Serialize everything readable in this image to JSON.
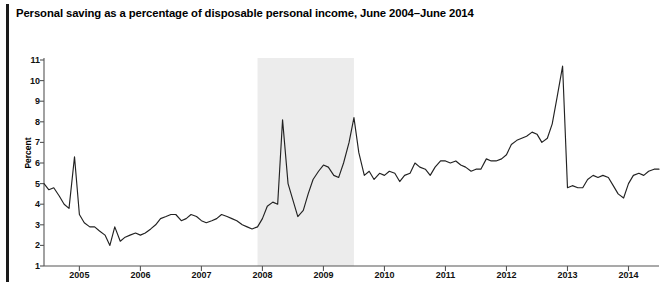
{
  "figure": {
    "title": "Personal saving as a percentage of disposable personal income, June 2004–June 2014",
    "ylabel": "Percent"
  },
  "chart_data": {
    "type": "line",
    "title": "Personal saving as a percentage of disposable personal income, June 2004–June 2014",
    "xlabel": "",
    "ylabel": "Percent",
    "xlim": [
      2004.42,
      2014.5
    ],
    "ylim": [
      1,
      11
    ],
    "ytick_labels": [
      "1",
      "2",
      "3",
      "4",
      "5",
      "6",
      "7",
      "8",
      "9",
      "10",
      "11"
    ],
    "yticks": [
      1,
      2,
      3,
      4,
      5,
      6,
      7,
      8,
      9,
      10,
      11
    ],
    "xtick_labels": [
      "2005",
      "2006",
      "2007",
      "2008",
      "2009",
      "2010",
      "2011",
      "2012",
      "2013",
      "2014"
    ],
    "xticks": [
      2005,
      2006,
      2007,
      2008,
      2009,
      2010,
      2011,
      2012,
      2013,
      2014
    ],
    "grid": false,
    "legend": null,
    "line_color": "#222222",
    "shaded_regions": [
      {
        "name": "recession-band",
        "x_start": 2007.92,
        "x_end": 2009.5,
        "color": "#ececec"
      }
    ],
    "series": [
      {
        "name": "Personal saving rate",
        "x": [
          2004.42,
          2004.5,
          2004.58,
          2004.67,
          2004.75,
          2004.83,
          2004.92,
          2005.0,
          2005.08,
          2005.17,
          2005.25,
          2005.33,
          2005.42,
          2005.5,
          2005.58,
          2005.67,
          2005.75,
          2005.83,
          2005.92,
          2006.0,
          2006.08,
          2006.17,
          2006.25,
          2006.33,
          2006.42,
          2006.5,
          2006.58,
          2006.67,
          2006.75,
          2006.83,
          2006.92,
          2007.0,
          2007.08,
          2007.17,
          2007.25,
          2007.33,
          2007.42,
          2007.5,
          2007.58,
          2007.67,
          2007.75,
          2007.83,
          2007.92,
          2008.0,
          2008.08,
          2008.17,
          2008.25,
          2008.33,
          2008.42,
          2008.5,
          2008.58,
          2008.67,
          2008.75,
          2008.83,
          2008.92,
          2009.0,
          2009.08,
          2009.17,
          2009.25,
          2009.33,
          2009.42,
          2009.5,
          2009.58,
          2009.67,
          2009.75,
          2009.83,
          2009.92,
          2010.0,
          2010.08,
          2010.17,
          2010.25,
          2010.33,
          2010.42,
          2010.5,
          2010.58,
          2010.67,
          2010.75,
          2010.83,
          2010.92,
          2011.0,
          2011.08,
          2011.17,
          2011.25,
          2011.33,
          2011.42,
          2011.5,
          2011.58,
          2011.67,
          2011.75,
          2011.83,
          2011.92,
          2012.0,
          2012.08,
          2012.17,
          2012.25,
          2012.33,
          2012.42,
          2012.5,
          2012.58,
          2012.67,
          2012.75,
          2012.83,
          2012.92,
          2013.0,
          2013.08,
          2013.17,
          2013.25,
          2013.33,
          2013.42,
          2013.5,
          2013.58,
          2013.67,
          2013.75,
          2013.83,
          2013.92,
          2014.0,
          2014.08,
          2014.17,
          2014.25,
          2014.33,
          2014.42,
          2014.5
        ],
        "values": [
          5.0,
          4.7,
          4.8,
          4.4,
          4.0,
          3.8,
          6.3,
          3.5,
          3.1,
          2.9,
          2.9,
          2.7,
          2.5,
          2.0,
          2.9,
          2.2,
          2.4,
          2.5,
          2.6,
          2.5,
          2.6,
          2.8,
          3.0,
          3.3,
          3.4,
          3.5,
          3.5,
          3.2,
          3.3,
          3.5,
          3.4,
          3.2,
          3.1,
          3.2,
          3.3,
          3.5,
          3.4,
          3.3,
          3.2,
          3.0,
          2.9,
          2.8,
          2.9,
          3.3,
          3.9,
          4.1,
          4.0,
          8.1,
          5.0,
          4.2,
          3.4,
          3.7,
          4.5,
          5.2,
          5.6,
          5.9,
          5.8,
          5.4,
          5.3,
          6.0,
          7.0,
          8.2,
          6.5,
          5.4,
          5.6,
          5.2,
          5.5,
          5.4,
          5.6,
          5.5,
          5.1,
          5.4,
          5.5,
          6.0,
          5.8,
          5.7,
          5.4,
          5.8,
          6.1,
          6.1,
          6.0,
          6.1,
          5.9,
          5.8,
          5.6,
          5.7,
          5.7,
          6.2,
          6.1,
          6.1,
          6.2,
          6.4,
          6.9,
          7.1,
          7.2,
          7.3,
          7.5,
          7.4,
          7.0,
          7.2,
          7.9,
          9.2,
          10.7,
          4.8,
          4.9,
          4.8,
          4.8,
          5.2,
          5.4,
          5.3,
          5.4,
          5.3,
          4.9,
          4.5,
          4.3,
          5.0,
          5.4,
          5.5,
          5.4,
          5.6,
          5.7,
          5.7
        ]
      }
    ],
    "annotations": [
      {
        "name": "line-break-2014",
        "description": "small gap in plotted line near early 2014"
      }
    ]
  }
}
